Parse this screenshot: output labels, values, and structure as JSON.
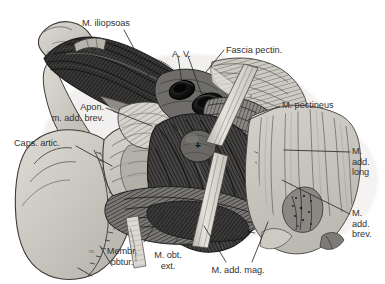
{
  "figure": {
    "domain": "anatomical-illustration",
    "title_visible": "",
    "width": 385,
    "height": 284,
    "background_color": "#ffffff",
    "style": "engraved halftone anatomical dissection drawing, grayscale"
  },
  "labels": [
    {
      "id": "m-iliopsoas",
      "text": "M. iliopsoas",
      "align": "left",
      "x": 82,
      "y": 18,
      "name": "label-m-iliopsoas"
    },
    {
      "id": "a-v",
      "text": "A. V.",
      "align": "left",
      "x": 172,
      "y": 49,
      "name": "label-a-v"
    },
    {
      "id": "fascia-pectin",
      "text": "Fascia pectin.",
      "align": "left",
      "x": 226,
      "y": 45,
      "name": "label-fascia-pectin"
    },
    {
      "id": "m-pectineus",
      "text": "M. pectineus",
      "align": "left",
      "x": 282,
      "y": 100,
      "name": "label-m-pectineus"
    },
    {
      "id": "apon-add-brev",
      "text": "Apon.\nm. add. brev.",
      "align": "right",
      "x": 18,
      "y": 102,
      "name": "label-apon-m-add-brev"
    },
    {
      "id": "caps-artic",
      "text": "Caps. artic.",
      "align": "left",
      "x": 14,
      "y": 138,
      "name": "label-caps-artic"
    },
    {
      "id": "m-add-long",
      "text": "M.\nadd.\nlong",
      "align": "left",
      "x": 352,
      "y": 146,
      "name": "label-m-add-long"
    },
    {
      "id": "m-add-brev",
      "text": "M.\nadd.\nbrev.",
      "align": "left",
      "x": 352,
      "y": 208,
      "name": "label-m-add-brev"
    },
    {
      "id": "membr-obtur",
      "text": "Membr.\nobtur.",
      "align": "center",
      "x": 120,
      "y": 246,
      "name": "label-membr-obtur"
    },
    {
      "id": "m-obt-ext",
      "text": "M. obt.\next.",
      "align": "center",
      "x": 168,
      "y": 250,
      "name": "label-m-obt-ext"
    },
    {
      "id": "m-add-mag",
      "text": "M. add. mag.",
      "align": "center",
      "x": 238,
      "y": 265,
      "name": "label-m-add-mag"
    }
  ],
  "marks": [
    {
      "id": "cross-mark",
      "symbol": "+",
      "x": 199,
      "y": 146,
      "name": "cross-reference-mark"
    },
    {
      "id": "small-m",
      "symbol": "m.",
      "x": 90,
      "y": 249,
      "name": "small-m-annotation"
    }
  ],
  "colors": {
    "background": "#ffffff",
    "bone_fill": "#c9c6bf",
    "bone_fill_light": "#d8d5ce",
    "bone_outline": "#3a3732",
    "muscle_dark": "#3b3a38",
    "muscle_mid": "#6e6c68",
    "fascia_light": "#cfccc6",
    "vessel_dark": "#151515",
    "label_text": "#323232",
    "leader_line": "#2c2c2c"
  },
  "structures": [
    {
      "name": "ilium-bone",
      "tone": "light-gray"
    },
    {
      "name": "m-iliopsoas",
      "tone": "dark"
    },
    {
      "name": "femoral-artery",
      "tone": "very-dark"
    },
    {
      "name": "femoral-vein",
      "tone": "very-dark"
    },
    {
      "name": "fascia-pectinea",
      "tone": "mid-light"
    },
    {
      "name": "m-pectineus",
      "tone": "mid"
    },
    {
      "name": "aponeurosis-adductor-brevis",
      "tone": "light"
    },
    {
      "name": "capsula-articularis",
      "tone": "light-gray"
    },
    {
      "name": "membrana-obturatoria",
      "tone": "mid"
    },
    {
      "name": "m-obturatorius-externus",
      "tone": "dark"
    },
    {
      "name": "m-adductor-magnus",
      "tone": "dark"
    },
    {
      "name": "m-adductor-longus",
      "tone": "light-striated"
    },
    {
      "name": "m-adductor-brevis",
      "tone": "light-striated"
    },
    {
      "name": "retractor-band-upper",
      "tone": "pale"
    },
    {
      "name": "retractor-band-lower",
      "tone": "pale"
    }
  ]
}
